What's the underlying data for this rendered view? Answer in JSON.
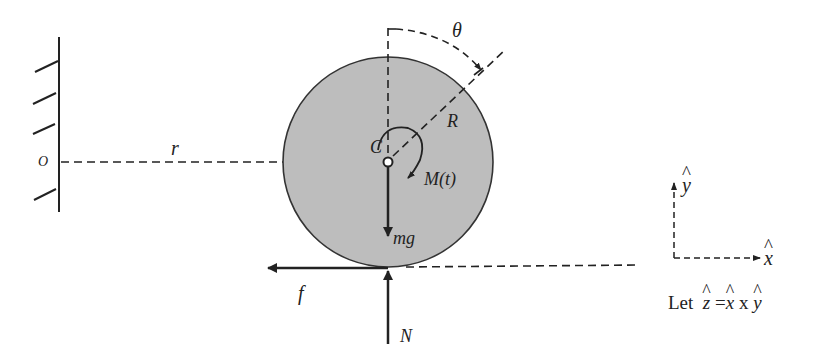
{
  "diagram": {
    "colors": {
      "disk_fill": "#bdbdbd",
      "stroke": "#222222"
    },
    "labels": {
      "origin": "O",
      "radial_distance": "r",
      "center": "C",
      "radius": "R",
      "angle": "θ",
      "moment": "M(t)",
      "weight": "mg",
      "friction": "f",
      "normal": "N",
      "x_axis": "x",
      "y_axis": "y"
    },
    "note": {
      "prefix": "Let",
      "lhs": "z",
      "eq": "=",
      "a": "x",
      "op": "x",
      "b": "y"
    }
  }
}
